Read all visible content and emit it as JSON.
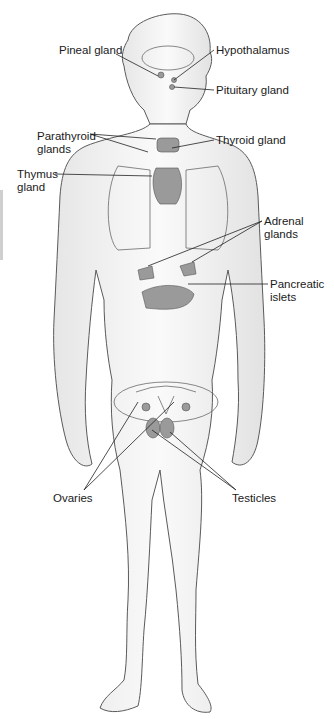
{
  "diagram": {
    "labels": [
      {
        "id": "pineal",
        "text": "Pineal gland",
        "x": 59,
        "y": 44
      },
      {
        "id": "hypothalamus",
        "text": "Hypothalamus",
        "x": 216,
        "y": 44
      },
      {
        "id": "pituitary",
        "text": "Pituitary gland",
        "x": 216,
        "y": 84
      },
      {
        "id": "parathyroid",
        "text": "Parathyroid\nglands",
        "x": 37,
        "y": 130
      },
      {
        "id": "thyroid",
        "text": "Thyroid gland",
        "x": 216,
        "y": 134
      },
      {
        "id": "thymus",
        "text": "Thymus\ngland",
        "x": 17,
        "y": 168
      },
      {
        "id": "adrenal",
        "text": "Adrenal\nglands",
        "x": 264,
        "y": 215
      },
      {
        "id": "pancreatic",
        "text": "Pancreatic\nislets",
        "x": 270,
        "y": 278
      },
      {
        "id": "ovaries",
        "text": "Ovaries",
        "x": 53,
        "y": 492
      },
      {
        "id": "testicles",
        "text": "Testicles",
        "x": 232,
        "y": 492
      }
    ],
    "colors": {
      "outline": "#5a5a5a",
      "skin": "#f4f4f4",
      "gland": "#9a9a9a",
      "leader": "#222222",
      "text": "#1a1a1a"
    }
  }
}
